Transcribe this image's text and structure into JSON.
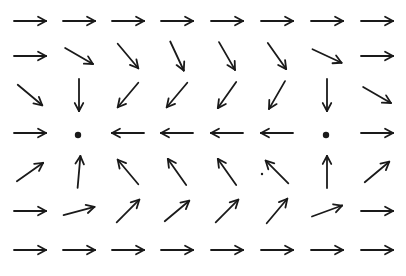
{
  "diagram": {
    "type": "vector-field",
    "width": 406,
    "height": 276,
    "stroke_color": "#1a1a1a",
    "columns_x": [
      30,
      79,
      128,
      177,
      227,
      277,
      327,
      377
    ],
    "rows_y": [
      21,
      56,
      95,
      133,
      172,
      211,
      250
    ],
    "arrow_length": 32,
    "critical_points": [
      {
        "row": 3,
        "col": 1,
        "x": 78,
        "y": 135,
        "label": "equilibrium-point"
      },
      {
        "row": 3,
        "col": 6,
        "x": 326,
        "y": 135,
        "label": "equilibrium-point"
      }
    ],
    "stray_dot": {
      "x": 262,
      "y": 174
    },
    "grid_angles_deg": [
      [
        0,
        0,
        0,
        0,
        0,
        0,
        0,
        0
      ],
      [
        0,
        30,
        50,
        65,
        60,
        55,
        25,
        0
      ],
      [
        40,
        90,
        130,
        130,
        125,
        120,
        90,
        30
      ],
      [
        0,
        null,
        180,
        180,
        180,
        180,
        null,
        0
      ],
      [
        -35,
        -85,
        -130,
        -125,
        -125,
        -135,
        -90,
        -40
      ],
      [
        0,
        -15,
        -45,
        -40,
        -45,
        -50,
        -20,
        0
      ],
      [
        0,
        0,
        0,
        0,
        0,
        0,
        0,
        0
      ]
    ]
  }
}
